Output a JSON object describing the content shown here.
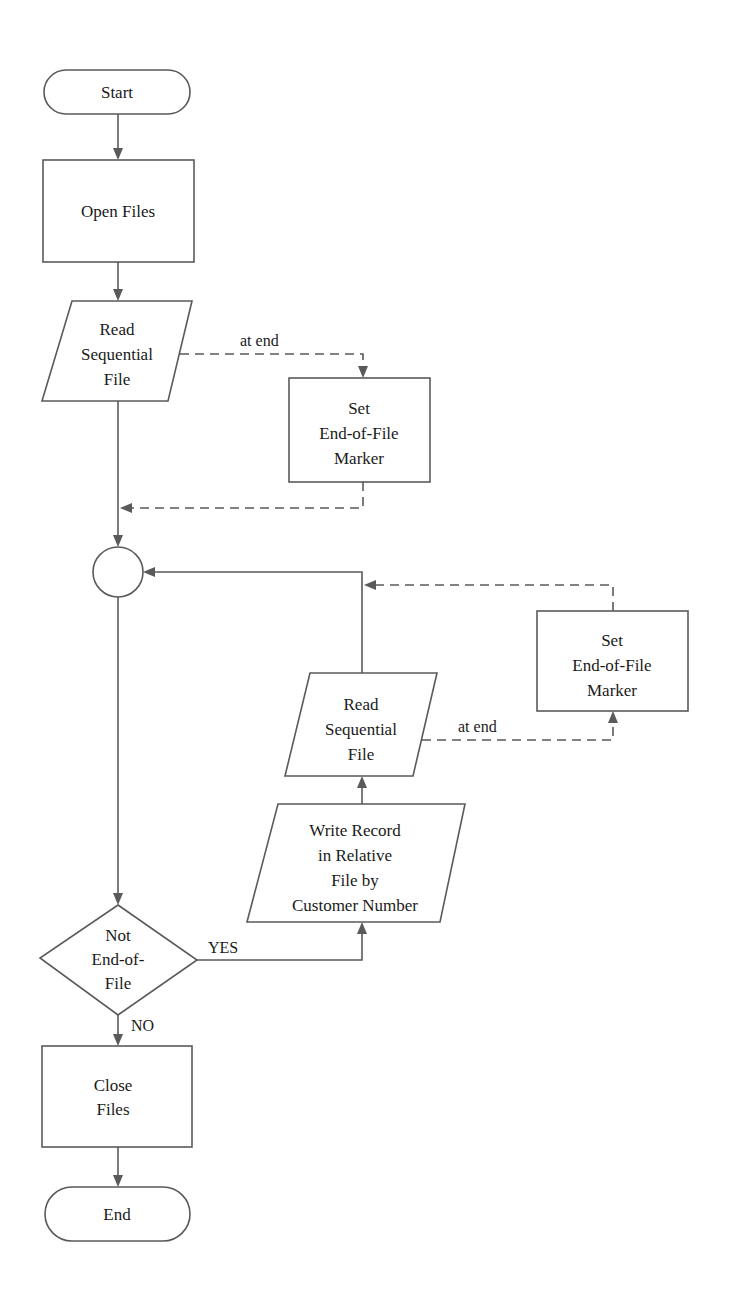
{
  "diagram": {
    "type": "flowchart",
    "nodes": {
      "start": {
        "shape": "terminal",
        "lines": [
          "Start"
        ]
      },
      "open_files": {
        "shape": "process",
        "lines": [
          "Open Files"
        ]
      },
      "read_seq_1": {
        "shape": "io",
        "lines": [
          "Read",
          "Sequential",
          "File"
        ]
      },
      "set_eof_1": {
        "shape": "process",
        "lines": [
          "Set",
          "End-of-File",
          "Marker"
        ]
      },
      "connector": {
        "shape": "connector",
        "lines": []
      },
      "decision": {
        "shape": "decision",
        "lines": [
          "Not",
          "End-of-",
          "File"
        ]
      },
      "write_record": {
        "shape": "io",
        "lines": [
          "Write Record",
          "in Relative",
          "File by",
          "Customer Number"
        ]
      },
      "read_seq_2": {
        "shape": "io",
        "lines": [
          "Read",
          "Sequential",
          "File"
        ]
      },
      "set_eof_2": {
        "shape": "process",
        "lines": [
          "Set",
          "End-of-File",
          "Marker"
        ]
      },
      "close_files": {
        "shape": "process",
        "lines": [
          "Close",
          "Files"
        ]
      },
      "end": {
        "shape": "terminal",
        "lines": [
          "End"
        ]
      }
    },
    "edges": [
      {
        "from": "start",
        "to": "open_files",
        "style": "solid",
        "label": ""
      },
      {
        "from": "open_files",
        "to": "read_seq_1",
        "style": "solid",
        "label": ""
      },
      {
        "from": "read_seq_1",
        "to": "set_eof_1",
        "style": "dashed",
        "label": "at end"
      },
      {
        "from": "set_eof_1",
        "to": "connector",
        "style": "dashed",
        "label": ""
      },
      {
        "from": "read_seq_1",
        "to": "connector",
        "style": "solid",
        "label": ""
      },
      {
        "from": "connector",
        "to": "decision",
        "style": "solid",
        "label": ""
      },
      {
        "from": "decision",
        "to": "write_record",
        "style": "solid",
        "label": "YES"
      },
      {
        "from": "write_record",
        "to": "read_seq_2",
        "style": "solid",
        "label": ""
      },
      {
        "from": "read_seq_2",
        "to": "set_eof_2",
        "style": "dashed",
        "label": "at end"
      },
      {
        "from": "set_eof_2",
        "to": "connector",
        "style": "dashed",
        "label": ""
      },
      {
        "from": "read_seq_2",
        "to": "connector",
        "style": "solid",
        "label": ""
      },
      {
        "from": "decision",
        "to": "close_files",
        "style": "solid",
        "label": "NO"
      },
      {
        "from": "close_files",
        "to": "end",
        "style": "solid",
        "label": ""
      }
    ],
    "edge_labels": {
      "at_end_1": "at end",
      "at_end_2": "at end",
      "yes": "YES",
      "no": "NO"
    }
  }
}
